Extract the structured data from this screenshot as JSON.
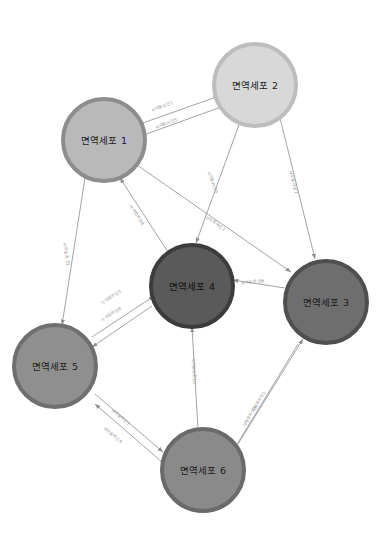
{
  "diagram": {
    "type": "node-link-graph",
    "background": "#ffffff",
    "edge_color": "#9a9a9a",
    "edge_label_color": "#8a8a8a"
  },
  "nodes": [
    {
      "id": "cell1",
      "label": "면역세포 1",
      "cx": 104,
      "cy": 140,
      "r": 41,
      "fill": "#b9b9b9",
      "stroke": "#8d8d8d",
      "stroke_width": 4,
      "text_color": "#1c1c1c"
    },
    {
      "id": "cell2",
      "label": "면역세포 2",
      "cx": 255,
      "cy": 85,
      "r": 41,
      "fill": "#d8d8d8",
      "stroke": "#bdbdbd",
      "stroke_width": 4,
      "text_color": "#1c1c1c"
    },
    {
      "id": "cell3",
      "label": "면역세포 3",
      "cx": 326,
      "cy": 302,
      "r": 41,
      "fill": "#6e6e6e",
      "stroke": "#4f4f4f",
      "stroke_width": 4,
      "text_color": "#1c1c1c"
    },
    {
      "id": "cell4",
      "label": "면역세포 4",
      "cx": 192,
      "cy": 286,
      "r": 41,
      "fill": "#5a5a5a",
      "stroke": "#3c3c3c",
      "stroke_width": 4,
      "text_color": "#111111"
    },
    {
      "id": "cell5",
      "label": "면역세포 5",
      "cx": 55,
      "cy": 366,
      "r": 41,
      "fill": "#8f8f8f",
      "stroke": "#6f6f6f",
      "stroke_width": 4,
      "text_color": "#1c1c1c"
    },
    {
      "id": "cell6",
      "label": "면역세포 6",
      "cx": 203,
      "cy": 470,
      "r": 41,
      "fill": "#8a8a8a",
      "stroke": "#6a6a6a",
      "stroke_width": 4,
      "text_color": "#1c1c1c"
    }
  ],
  "edges": [
    {
      "id": "e1",
      "label": "사이토카인1",
      "from": "cell1",
      "to": "cell2",
      "x1": 140,
      "y1": 124,
      "x2": 219,
      "y2": 96,
      "lx": 151,
      "ly": 107,
      "angle": -20
    },
    {
      "id": "e5",
      "label": "사이토카인5",
      "from": "cell2",
      "to": "cell1",
      "x1": 221,
      "y1": 107,
      "x2": 141,
      "y2": 136,
      "lx": 155,
      "ly": 124,
      "angle": -20
    },
    {
      "id": "e9",
      "label": "사이토카인9",
      "from": "cell2",
      "to": "cell4",
      "x1": 240,
      "y1": 122,
      "x2": 196,
      "y2": 243,
      "lx": 209,
      "ly": 168,
      "angle": 70
    },
    {
      "id": "e2",
      "label": "사이토카인2",
      "from": "cell1",
      "to": "cell3",
      "x1": 134,
      "y1": 163,
      "x2": 291,
      "y2": 272,
      "lx": 206,
      "ly": 213,
      "angle": 35
    },
    {
      "id": "e7",
      "label": "사이토카인7",
      "from": "cell2",
      "to": "cell3",
      "x1": 280,
      "y1": 118,
      "x2": 315,
      "y2": 259,
      "lx": 291,
      "ly": 168,
      "angle": 76
    },
    {
      "id": "e4",
      "label": "사이토카인4",
      "from": "cell4",
      "to": "cell1",
      "x1": 168,
      "y1": 252,
      "x2": 120,
      "y2": 178,
      "lx": 131,
      "ly": 202,
      "angle": 57
    },
    {
      "id": "e1b",
      "label": "사이토카인1",
      "from": "cell1",
      "to": "cell5",
      "x1": 85,
      "y1": 178,
      "x2": 62,
      "y2": 325,
      "lx": 65,
      "ly": 240,
      "angle": 81
    },
    {
      "id": "e3",
      "label": "사이토카인3",
      "from": "cell5",
      "to": "cell4",
      "x1": 92,
      "y1": 337,
      "x2": 154,
      "y2": 296,
      "lx": 101,
      "ly": 300,
      "angle": -33
    },
    {
      "id": "e8",
      "label": "사이토카인8",
      "from": "cell4",
      "to": "cell5",
      "x1": 152,
      "y1": 306,
      "x2": 92,
      "y2": 347,
      "lx": 101,
      "ly": 317,
      "angle": -33
    },
    {
      "id": "e6",
      "label": "사이토카인6",
      "from": "cell3",
      "to": "cell4",
      "x1": 285,
      "y1": 288,
      "x2": 233,
      "y2": 280,
      "lx": 241,
      "ly": 280,
      "angle": -8
    },
    {
      "id": "e10",
      "label": "사이토카인10",
      "from": "cell6",
      "to": "cell4",
      "x1": 198,
      "y1": 429,
      "x2": 192,
      "y2": 327,
      "lx": 194,
      "ly": 355,
      "angle": 88
    },
    {
      "id": "e1c",
      "label": "사이토카인1",
      "from": "cell5",
      "to": "cell6",
      "x1": 95,
      "y1": 394,
      "x2": 163,
      "y2": 452,
      "lx": 112,
      "ly": 406,
      "angle": 40
    },
    {
      "id": "e4b",
      "label": "사이토카인4",
      "from": "cell6",
      "to": "cell5",
      "x1": 162,
      "y1": 462,
      "x2": 95,
      "y2": 404,
      "lx": 104,
      "ly": 424,
      "angle": 40
    },
    {
      "id": "e1d",
      "label": "사이토카인1",
      "from": "cell6",
      "to": "cell3",
      "x1": 238,
      "y1": 444,
      "x2": 303,
      "y2": 339,
      "lx": 252,
      "ly": 408,
      "angle": -58
    },
    {
      "id": "e5b",
      "label": "사이토카인5",
      "from": "cell3",
      "to": "cell6",
      "x1": 298,
      "y1": 344,
      "x2": 233,
      "y2": 451,
      "lx": 243,
      "ly": 423,
      "angle": -58
    }
  ]
}
